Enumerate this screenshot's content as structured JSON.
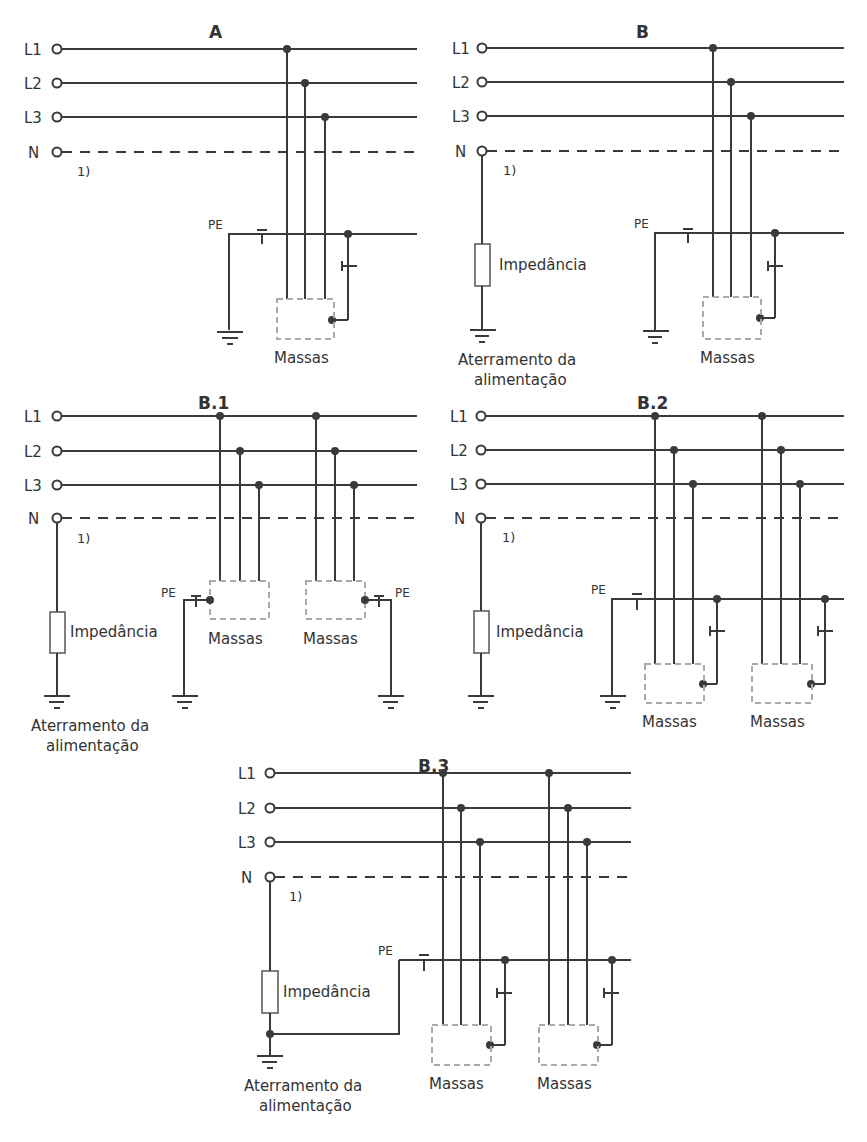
{
  "figure": {
    "panels": [
      {
        "id": "A",
        "title": "A",
        "ox": 0,
        "oy": 0,
        "conductors": [
          "L1",
          "L2",
          "L3",
          "N"
        ],
        "neutral_note": "1)",
        "pe_label": "PE",
        "masses_label": "Massas",
        "has_impedance": false
      },
      {
        "id": "B",
        "title": "B",
        "ox": 430,
        "oy": 0,
        "conductors": [
          "L1",
          "L2",
          "L3",
          "N"
        ],
        "neutral_note": "1)",
        "pe_label": "PE",
        "masses_label": "Massas",
        "impedance_label": "Impedância",
        "grounding_label_line1": "Aterramento da",
        "grounding_label_line2": "alimentação",
        "has_impedance": true
      },
      {
        "id": "B.1",
        "title": "B.1",
        "conductors": [
          "L1",
          "L2",
          "L3",
          "N"
        ],
        "neutral_note": "1)",
        "pe_label_left": "PE",
        "pe_label_right": "PE",
        "masses_label_1": "Massas",
        "masses_label_2": "Massas",
        "impedance_label": "Impedância",
        "grounding_label_line1": "Aterramento da",
        "grounding_label_line2": "alimentação"
      },
      {
        "id": "B.2",
        "title": "B.2",
        "conductors": [
          "L1",
          "L2",
          "L3",
          "N"
        ],
        "neutral_note": "1)",
        "pe_label": "PE",
        "masses_label_1": "Massas",
        "masses_label_2": "Massas",
        "impedance_label": "Impedância"
      },
      {
        "id": "B.3",
        "title": "B.3",
        "conductors": [
          "L1",
          "L2",
          "L3",
          "N"
        ],
        "neutral_note": "1)",
        "pe_label": "PE",
        "masses_label_1": "Massas",
        "masses_label_2": "Massas",
        "impedance_label": "Impedância",
        "grounding_label_line1": "Aterramento da",
        "grounding_label_line2": "alimentação"
      }
    ]
  }
}
